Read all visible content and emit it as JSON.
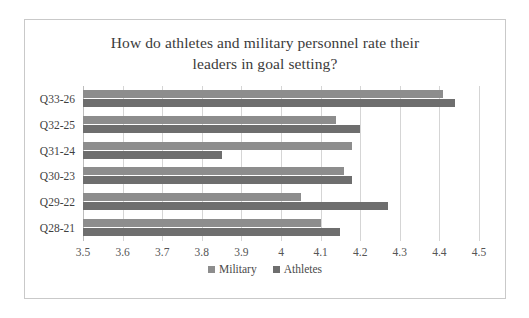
{
  "chart_data": {
    "type": "bar",
    "orientation": "horizontal",
    "title": "How do athletes and military personnel rate their leaders in goal setting?",
    "title_lines": [
      "How do athletes and military personnel rate their",
      "leaders in goal setting?"
    ],
    "categories": [
      "Q28-21",
      "Q29-22",
      "Q30-23",
      "Q31-24",
      "Q32-25",
      "Q33-26"
    ],
    "categories_top_to_bottom": [
      "Q33-26",
      "Q32-25",
      "Q31-24",
      "Q30-23",
      "Q29-22",
      "Q28-21"
    ],
    "series": [
      {
        "name": "Military",
        "color": "#8d8d8d",
        "values": [
          4.1,
          4.05,
          4.16,
          4.18,
          4.14,
          4.41
        ]
      },
      {
        "name": "Athletes",
        "color": "#6e6e6e",
        "values": [
          4.15,
          4.27,
          4.18,
          3.85,
          4.2,
          4.44
        ]
      }
    ],
    "xlabel": "",
    "ylabel": "",
    "xlim": [
      3.5,
      4.5
    ],
    "xticks": [
      "3.5",
      "3.6",
      "3.7",
      "3.8",
      "3.9",
      "4",
      "4.1",
      "4.2",
      "4.3",
      "4.4",
      "4.5"
    ],
    "xtick_values": [
      3.5,
      3.6,
      3.7,
      3.8,
      3.9,
      4.0,
      4.1,
      4.2,
      4.3,
      4.4,
      4.5
    ],
    "grid": true,
    "grid_axis": "x",
    "legend": [
      "Military",
      "Athletes"
    ],
    "legend_position": "bottom"
  }
}
